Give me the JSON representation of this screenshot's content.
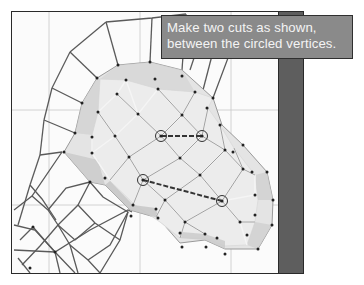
{
  "caption": {
    "line1": "Make two cuts as shown,",
    "line2": "between the circled vertices."
  },
  "colors": {
    "background": "#ffffff",
    "viewport": "#fbfbfb",
    "grid": "#c8c8c8",
    "wire": "#555555",
    "face": "#d8d8d8",
    "face_edge": "#e6e6e6",
    "vertex": "#222222",
    "sidebar": "#5e5e5e",
    "caption_bg": "#8a8a8a",
    "caption_text": "#f4f4f4"
  },
  "viewport": {
    "grid_x": [
      49,
      140,
      231
    ],
    "grid_y": [
      110,
      205
    ]
  },
  "cuts": [
    {
      "from": [
        161,
        136
      ],
      "to": [
        202,
        136
      ]
    },
    {
      "from": [
        143,
        180
      ],
      "to": [
        222,
        201
      ]
    }
  ],
  "circled_vertices": [
    [
      161,
      136
    ],
    [
      202,
      136
    ],
    [
      143,
      180
    ],
    [
      222,
      201
    ]
  ]
}
